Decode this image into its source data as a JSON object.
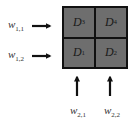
{
  "diagram": {
    "type": "2x2 grid with input arrows",
    "colors": {
      "cell_fill": "#6e6e6e",
      "grid_lines": "#111111",
      "arrow": "#111111",
      "text": "#1a1a1a",
      "background": "#ffffff"
    },
    "cells": [
      {
        "base": "D",
        "sub": "3",
        "row": 1,
        "col": 1
      },
      {
        "base": "D",
        "sub": "4",
        "row": 1,
        "col": 2
      },
      {
        "base": "D",
        "sub": "1",
        "row": 2,
        "col": 1
      },
      {
        "base": "D",
        "sub": "2",
        "row": 2,
        "col": 2
      }
    ],
    "row_inputs": [
      {
        "base": "w",
        "sub": "1,1",
        "direction": "right",
        "target_row": 1
      },
      {
        "base": "w",
        "sub": "1,2",
        "direction": "right",
        "target_row": 2
      }
    ],
    "column_inputs": [
      {
        "base": "w",
        "sub": "2,1",
        "direction": "up",
        "target_col": 1
      },
      {
        "base": "w",
        "sub": "2,2",
        "direction": "up",
        "target_col": 2
      }
    ]
  }
}
